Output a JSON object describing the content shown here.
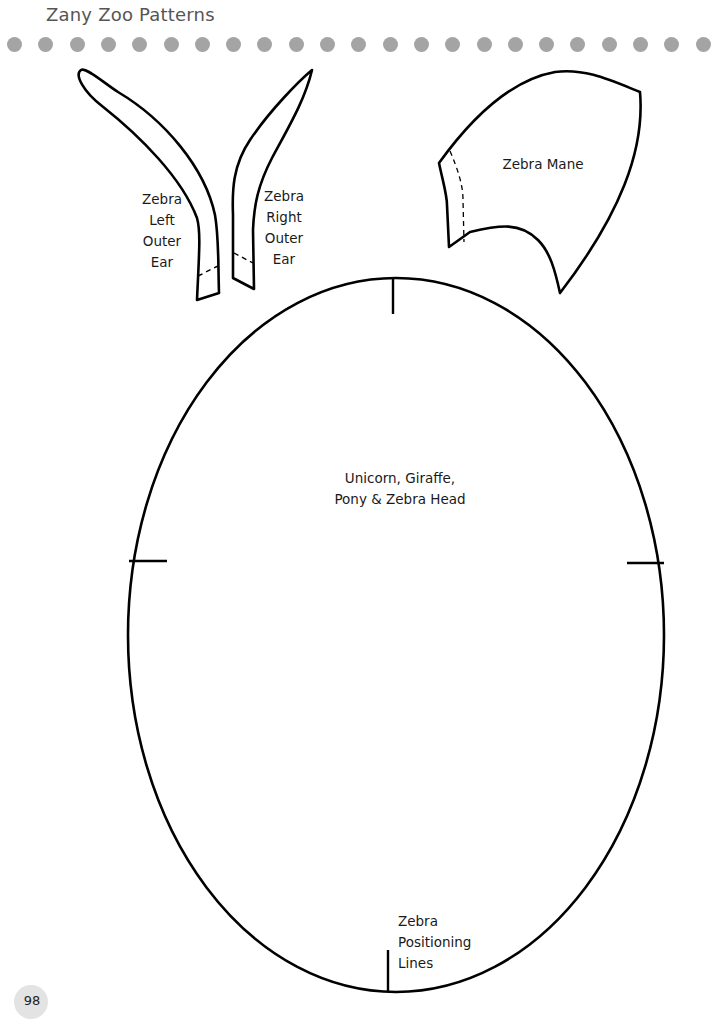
{
  "header": {
    "title": "Zany Zoo Patterns",
    "dot_count": 23,
    "dot_color": "#a4a4a4"
  },
  "patterns": {
    "left_ear": {
      "label_lines": [
        "Zebra",
        "Left",
        "Outer",
        "Ear"
      ]
    },
    "right_ear": {
      "label_lines": [
        "Zebra",
        "Right",
        "Outer",
        "Ear"
      ]
    },
    "mane": {
      "label": "Zebra Mane"
    },
    "head": {
      "label_lines": [
        "Unicorn, Giraffe,",
        "Pony & Zebra Head"
      ]
    },
    "positioning": {
      "label_lines": [
        "Zebra",
        "Positioning",
        "Lines"
      ]
    }
  },
  "footer": {
    "page_number": "98"
  },
  "colors": {
    "line": "#000000",
    "text": "#1a1a1a",
    "badge": "#e3e3e3"
  }
}
